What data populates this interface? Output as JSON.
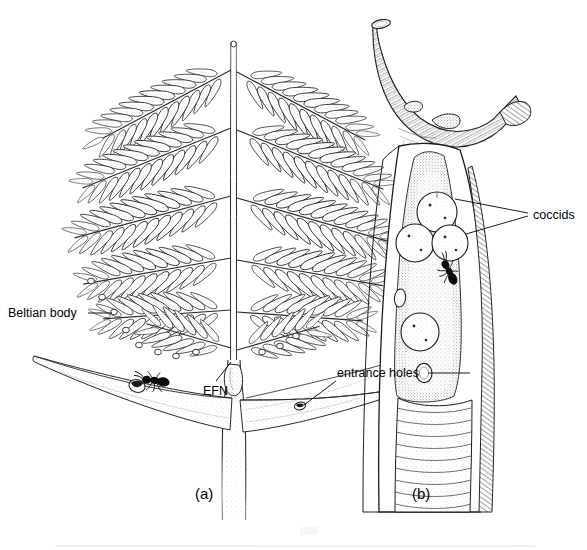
{
  "figure": {
    "kind": "scientific-line-drawing",
    "background_color": "#ffffff",
    "ink_color": "#000000",
    "panels": [
      {
        "id": "a",
        "label": "(a)",
        "label_x": 195,
        "label_y": 499,
        "description": "Bipinnate acacia leaf with paired stipular thorns, Beltian bodies at leaflet tips, extrafloral nectary on petiole, and an ant at a thorn entrance hole"
      },
      {
        "id": "b",
        "label": "(b)",
        "label_x": 412,
        "label_y": 499,
        "description": "Cut-open swollen thorn on a woody stem showing coccids, an ant inside the chamber, and entrance holes"
      }
    ],
    "annotations": [
      {
        "id": "beltian-body",
        "text": "Beltian body",
        "text_x": 8,
        "text_y": 317,
        "anchor": "start",
        "leader": "M 88 313 L 112 313"
      },
      {
        "id": "efn",
        "text": "EFN",
        "text_x": 203,
        "text_y": 395,
        "anchor": "start",
        "leader": "M 216 381 L 231 362"
      },
      {
        "id": "entrance-holes",
        "text": "entrance holes",
        "text_x": 337,
        "text_y": 377,
        "anchor": "start",
        "leader_right": "M 428 373 L 470 373",
        "leader_left": "M 340 381 L 302 406"
      },
      {
        "id": "coccids",
        "text": "coccids",
        "text_x": 533,
        "text_y": 219,
        "anchor": "start",
        "leader_upper": "M 528 213 L 455 198",
        "leader_lower": "M 528 216 L 452 230"
      }
    ],
    "features": {
      "leaf": {
        "name": "bipinnate compound leaf",
        "rachis_x": 233,
        "rachis_top_y": 40,
        "rachis_bottom_y": 362,
        "pinnae_pairs": 6,
        "leaflets_per_pinna": 13
      },
      "thorns_panel_a": {
        "name": "paired stipular spines",
        "count": 2,
        "entrance_holes": 2
      },
      "ant_panel_a": {
        "name": "ant",
        "x": 152,
        "y": 381
      },
      "thorn_panel_b": {
        "name": "swollen thorn (domatium)",
        "coccid_count": 4,
        "entrance_hole_count": 1,
        "ant_count": 1
      }
    }
  }
}
